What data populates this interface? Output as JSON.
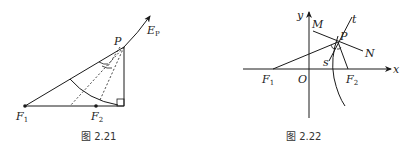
{
  "figures": [
    {
      "id": "fig-2-21",
      "caption": "图 2.21",
      "labels": {
        "P": "P",
        "E": "E",
        "E_sub": "P",
        "F1": "F",
        "F1_sub": "1",
        "F2": "F",
        "F2_sub": "2"
      }
    },
    {
      "id": "fig-2-22",
      "caption": "图 2.22",
      "labels": {
        "y": "y",
        "x": "x",
        "O": "O",
        "M": "M",
        "N": "N",
        "P": "P",
        "t": "t",
        "s": "s",
        "F1": "F",
        "F1_sub": "1",
        "F2": "F",
        "F2_sub": "2"
      }
    }
  ],
  "colors": {
    "stroke": "#1a1a1a",
    "background": "#ffffff"
  }
}
